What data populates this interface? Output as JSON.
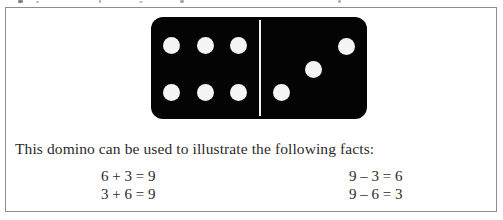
{
  "figure": {
    "caption": "This domino can be used to illustrate the following facts:",
    "border_color": "#8d8d8d",
    "background_color": "#ffffff"
  },
  "domino": {
    "name": "domino-6-3",
    "body_color": "#040404",
    "pip_color": "#f4f4f4",
    "divider_color": "#f2f2f2",
    "left_half": {
      "pip_count": "6",
      "arrangement": "two-rows-of-three"
    },
    "right_half": {
      "pip_count": "3",
      "arrangement": "diagonal"
    }
  },
  "facts": {
    "rows": [
      {
        "addition": "6 + 3 = 9",
        "subtraction": "9 – 3 = 6"
      },
      {
        "addition": "3 + 6 = 9",
        "subtraction": "9 – 6 = 3"
      }
    ]
  }
}
